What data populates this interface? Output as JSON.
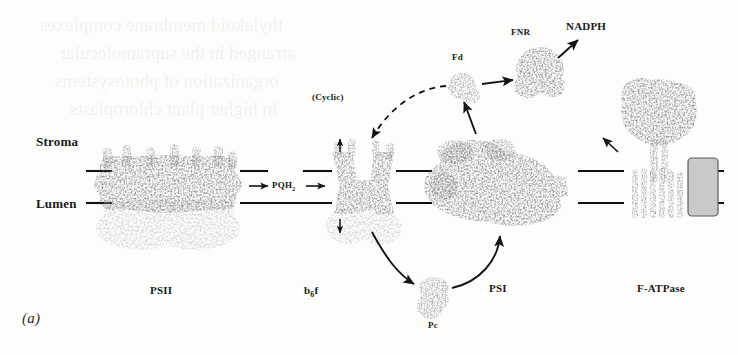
{
  "figure": {
    "panel_label": "(a)",
    "caption_hint": "photosynthetic electron transport chain in the thylakoid membrane",
    "background_color": "#fdfdfc",
    "ink_color": "#1a1a1a",
    "membrane_color": "#111111",
    "atpase_box_color": "#c9c9c9"
  },
  "compartments": {
    "upper_label": "Stroma",
    "lower_label": "Lumen"
  },
  "complexes": [
    {
      "id": "psii",
      "label": "PSII",
      "label_x": 150,
      "label_y": 291
    },
    {
      "id": "b6f",
      "label_html": "b<sub>6</sub>f",
      "label_base": "b",
      "label_sub": "6",
      "label_tail": "f",
      "label_x": 304,
      "label_y": 291
    },
    {
      "id": "psi",
      "label": "PSI",
      "label_x": 492,
      "label_y": 289
    },
    {
      "id": "fatpase",
      "label": "F-ATPase",
      "label_x": 640,
      "label_y": 289
    }
  ],
  "mobile_carriers": [
    {
      "id": "pqh2",
      "label_base": "PQH",
      "label_sub": "2",
      "label_x": 278,
      "label_y": 181
    },
    {
      "id": "fd",
      "label": "Fd",
      "label_x": 455,
      "label_y": 56
    },
    {
      "id": "fnr",
      "label": "FNR",
      "label_x": 513,
      "label_y": 33
    },
    {
      "id": "pc",
      "label": "Pc",
      "label_x": 434,
      "label_y": 326
    }
  ],
  "products": [
    {
      "id": "nadph",
      "label": "NADPH",
      "label_x": 572,
      "label_y": 28
    }
  ],
  "annotations": [
    {
      "id": "cyclic",
      "label": "(Cyclic)",
      "label_x": 316,
      "label_y": 98
    }
  ],
  "membrane_segments": [
    {
      "id": "seg-left-upper",
      "x1": 86,
      "x2": 110,
      "y": 171
    },
    {
      "id": "seg-left-lower",
      "x1": 86,
      "x2": 110,
      "y": 203
    },
    {
      "id": "seg-mid-upper",
      "x1": 238,
      "x2": 268,
      "y": 171
    },
    {
      "id": "seg-mid-lower",
      "x1": 238,
      "x2": 330,
      "y": 203
    },
    {
      "id": "seg-mid2-upper",
      "x1": 303,
      "x2": 330,
      "y": 171
    },
    {
      "id": "seg-b6f-psi-up",
      "x1": 394,
      "x2": 430,
      "y": 171
    },
    {
      "id": "seg-b6f-psi-lo",
      "x1": 394,
      "x2": 430,
      "y": 203
    },
    {
      "id": "seg-psi-atp-up",
      "x1": 577,
      "x2": 622,
      "y": 171
    },
    {
      "id": "seg-psi-atp-lo",
      "x1": 577,
      "x2": 622,
      "y": 203
    },
    {
      "id": "seg-right-upper",
      "x1": 692,
      "x2": 722,
      "y": 171
    },
    {
      "id": "seg-right-lower",
      "x1": 692,
      "x2": 722,
      "y": 203
    }
  ],
  "flow_arrows": [
    {
      "id": "pqh2-arrow-in",
      "type": "solid",
      "from": "psii",
      "to": "pqh2"
    },
    {
      "id": "pqh2-arrow-out",
      "type": "solid",
      "from": "pqh2",
      "to": "b6f"
    },
    {
      "id": "b6f-to-pc",
      "type": "curved",
      "from": "b6f",
      "to": "pc"
    },
    {
      "id": "pc-to-psi",
      "type": "curved",
      "from": "pc",
      "to": "psi"
    },
    {
      "id": "psi-to-fd",
      "type": "solid",
      "from": "psi",
      "to": "fd"
    },
    {
      "id": "fd-to-fnr",
      "type": "solid",
      "from": "fd",
      "to": "fnr"
    },
    {
      "id": "fnr-to-nadph",
      "type": "solid",
      "from": "fnr",
      "to": "nadph"
    },
    {
      "id": "fd-cyclic",
      "type": "dashed",
      "from": "fd",
      "to": "b6f"
    },
    {
      "id": "proton-up-b6f",
      "type": "solid",
      "from": "b6f",
      "to": "stroma"
    },
    {
      "id": "proton-dn-b6f",
      "type": "solid",
      "from": "b6f",
      "to": "lumen"
    },
    {
      "id": "proton-to-atp",
      "type": "solid",
      "from": "lumen",
      "to": "fatpase"
    }
  ]
}
